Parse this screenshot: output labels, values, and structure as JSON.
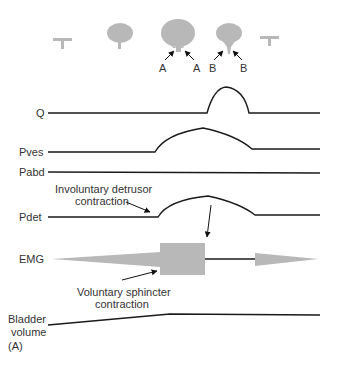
{
  "figure_label": "(A)",
  "colors": {
    "trace": "#1a1a1a",
    "fill_gray": "#b8b8b8",
    "text": "#333333",
    "background": "#ffffff"
  },
  "bladder_icons": [
    {
      "shape": "empty-t",
      "x": 62
    },
    {
      "shape": "small-bladder",
      "x": 120
    },
    {
      "shape": "large-bladder",
      "x": 178
    },
    {
      "shape": "medium-bladder",
      "x": 229
    },
    {
      "shape": "empty-t",
      "x": 270
    }
  ],
  "icon_arrow_labels": [
    "A",
    "A",
    "B",
    "B"
  ],
  "traces": {
    "q": {
      "label": "Q"
    },
    "pves": {
      "label": "Pves"
    },
    "pabd": {
      "label": "Pabd"
    },
    "pdet": {
      "label": "Pdet"
    },
    "emg": {
      "label": "EMG"
    },
    "bladder_volume": {
      "label_line1": "Bladder",
      "label_line2": "volume"
    }
  },
  "annotations": {
    "involuntary_line1": "Involuntary detrusor",
    "involuntary_line2": "contraction",
    "voluntary_line1": "Voluntary sphincter",
    "voluntary_line2": "contraction"
  }
}
